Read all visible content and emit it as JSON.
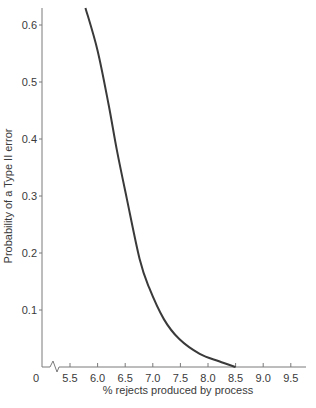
{
  "chart_data": {
    "type": "line",
    "title": "",
    "xlabel": "% rejects produced by process",
    "ylabel": "Probability of a Type II error",
    "xlim": [
      5.25,
      9.85
    ],
    "ylim": [
      0,
      0.63
    ],
    "x_axis_break": true,
    "x_origin_label": "0",
    "x_ticks": [
      5.5,
      6.0,
      6.5,
      7.0,
      7.5,
      8.0,
      8.5,
      9.0,
      9.5
    ],
    "x_tick_labels": [
      "5.5",
      "6.0",
      "6.5",
      "7.0",
      "7.5",
      "8.0",
      "8.5",
      "9.0",
      "9.5"
    ],
    "y_ticks": [
      0.1,
      0.2,
      0.3,
      0.4,
      0.5,
      0.6
    ],
    "y_tick_labels": [
      "0.1",
      "0.2",
      "0.3",
      "0.4",
      "0.5",
      "0.6"
    ],
    "grid": false,
    "legend": null,
    "series": [
      {
        "name": "Type II error probability",
        "color": "#3a3a3a",
        "x": [
          5.78,
          6.0,
          6.2,
          6.35,
          6.53,
          6.76,
          6.93,
          7.2,
          7.48,
          7.85,
          8.2,
          8.5
        ],
        "y": [
          0.63,
          0.555,
          0.46,
          0.38,
          0.295,
          0.19,
          0.14,
          0.084,
          0.049,
          0.023,
          0.01,
          0.0
        ]
      }
    ]
  }
}
